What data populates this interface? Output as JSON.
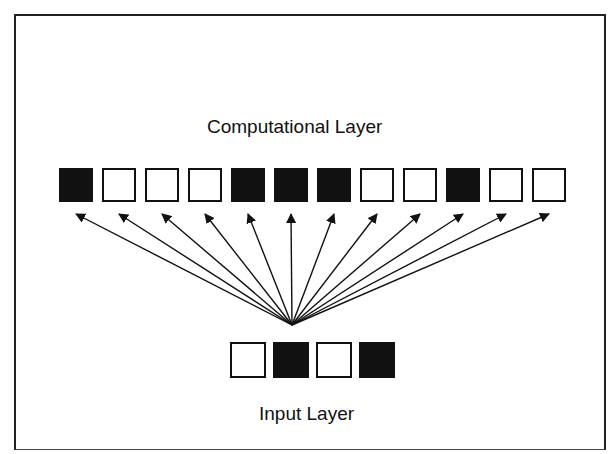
{
  "diagram": {
    "computational_layer": {
      "title": "Computational Layer",
      "cells": [
        1,
        0,
        0,
        0,
        1,
        1,
        1,
        0,
        0,
        1,
        0,
        0
      ]
    },
    "input_layer": {
      "title": "Input Layer",
      "cells": [
        0,
        1,
        0,
        1
      ]
    },
    "connections": "input layer fans out to every computational-layer cell (12 arrows from a single convergence point)",
    "colors": {
      "active": "#111111",
      "inactive": "#ffffff",
      "line": "#111111"
    }
  }
}
